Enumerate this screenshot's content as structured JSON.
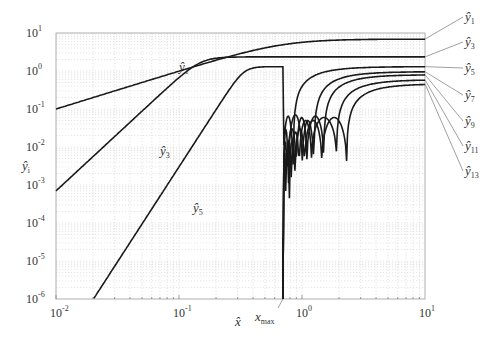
{
  "chart_data": {
    "type": "line",
    "title": "",
    "xlabel": "x̂",
    "ylabel": "ŷ_i",
    "xscale": "log",
    "yscale": "log",
    "xlim": [
      0.01,
      10
    ],
    "ylim": [
      1e-06,
      10
    ],
    "grid": true,
    "x_ticks": [
      {
        "value": 0.01,
        "base": "10",
        "exp": "-2"
      },
      {
        "value": 0.1,
        "base": "10",
        "exp": "-1"
      },
      {
        "value": 1,
        "base": "10",
        "exp": "0"
      },
      {
        "value": 10,
        "base": "10",
        "exp": "1"
      }
    ],
    "y_ticks": [
      {
        "value": 10,
        "base": "10",
        "exp": "1"
      },
      {
        "value": 1,
        "base": "10",
        "exp": "0"
      },
      {
        "value": 0.1,
        "base": "10",
        "exp": "-1"
      },
      {
        "value": 0.01,
        "base": "10",
        "exp": "-2"
      },
      {
        "value": 0.001,
        "base": "10",
        "exp": "-3"
      },
      {
        "value": 0.0001,
        "base": "10",
        "exp": "-4"
      },
      {
        "value": 1e-05,
        "base": "10",
        "exp": "-5"
      },
      {
        "value": 1e-06,
        "base": "10",
        "exp": "-6"
      }
    ],
    "annotation_xmax": {
      "label": "x",
      "sub": "max",
      "value": 0.7
    },
    "series": [
      {
        "name": "ŷ1",
        "sub": "1",
        "order": 1,
        "asymptote": 6.9,
        "knee": 0.5,
        "lowcoef": 10,
        "lobes": []
      },
      {
        "name": "ŷ3",
        "sub": "3",
        "order": 3,
        "asymptote": 2.35,
        "knee": 0.55,
        "lowcoef": 700,
        "lobes": []
      },
      {
        "name": "ŷ5",
        "sub": "5",
        "order": 5,
        "asymptote": 1.3,
        "knee": 0.6,
        "lowcoef": 300,
        "lobes": [
          [
            0.7,
            0.85,
            0.065,
            0.0005
          ]
        ]
      },
      {
        "name": "ŷ7",
        "sub": "7",
        "order": 7,
        "asymptote": 0.96,
        "knee": 0.9,
        "lowcoef": 0,
        "lobes": [
          [
            0.7,
            0.78,
            0.03,
            4e-05
          ],
          [
            0.78,
            1.0,
            0.07,
            0.002
          ],
          [
            1.0,
            1.25,
            0.05,
            0.0008
          ]
        ]
      },
      {
        "name": "ŷ9",
        "sub": "9",
        "order": 9,
        "asymptote": 0.8,
        "knee": 1.2,
        "lowcoef": 0,
        "lobes": [
          [
            0.7,
            0.76,
            0.015,
            3e-05
          ],
          [
            0.76,
            0.9,
            0.03,
            0.0007
          ],
          [
            0.9,
            1.1,
            0.06,
            0.0012
          ],
          [
            1.1,
            1.5,
            0.065,
            0.003
          ]
        ]
      },
      {
        "name": "ŷ11",
        "sub": "11",
        "order": 11,
        "asymptote": 0.59,
        "knee": 1.5,
        "lowcoef": 0,
        "lobes": [
          [
            0.7,
            0.74,
            0.008,
            2e-05
          ],
          [
            0.74,
            0.82,
            0.014,
            0.0003
          ],
          [
            0.82,
            0.95,
            0.025,
            0.0006
          ],
          [
            0.95,
            1.2,
            0.05,
            0.0015
          ],
          [
            1.2,
            1.9,
            0.06,
            0.004
          ]
        ]
      },
      {
        "name": "ŷ13",
        "sub": "13",
        "order": 13,
        "asymptote": 0.46,
        "knee": 1.9,
        "lowcoef": 0,
        "lobes": [
          [
            0.7,
            0.73,
            0.005,
            1e-05
          ],
          [
            0.73,
            0.79,
            0.009,
            0.0002
          ],
          [
            0.79,
            0.88,
            0.015,
            0.0004
          ],
          [
            0.88,
            1.05,
            0.03,
            0.001
          ],
          [
            1.05,
            1.45,
            0.05,
            0.002
          ],
          [
            1.45,
            2.3,
            0.06,
            0.0025
          ]
        ]
      }
    ],
    "curve_labels": [
      {
        "name": "ŷ1",
        "sub": "1",
        "at_x": 0.1,
        "at_y": 1.0
      },
      {
        "name": "ŷ3",
        "sub": "3",
        "at_x": 0.07,
        "at_y": 0.006
      },
      {
        "name": "ŷ5",
        "sub": "5",
        "at_x": 0.13,
        "at_y": 0.0002
      }
    ]
  }
}
